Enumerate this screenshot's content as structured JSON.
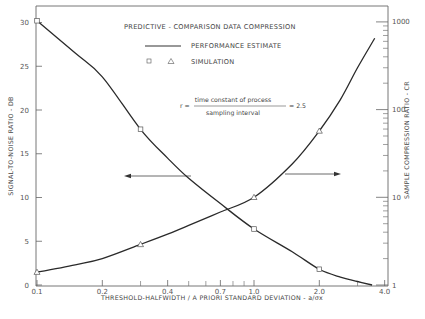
{
  "chart_data": {
    "type": "line",
    "title": "PREDICTIVE - COMPARISON DATA COMPRESSION",
    "xlabel": "THRESHOLD-HALFWIDTH / A PRIORI STANDARD DEVIATION - a/σx",
    "xscale": "log",
    "xlim": [
      0.1,
      4.0
    ],
    "x_ticks": [
      0.1,
      0.2,
      0.4,
      0.7,
      1.0,
      2.0,
      4.0
    ],
    "x_tick_labels": [
      "0.1",
      "0.2",
      "0.4",
      "0.7",
      "1.0",
      "2.0",
      "4.0"
    ],
    "x_minor_ticks": [
      0.3,
      0.5,
      0.6,
      0.8,
      0.9,
      3.0
    ],
    "y_left": {
      "label": "SIGNAL-TO-NOISE RATIO - DB",
      "scale": "linear",
      "lim": [
        0,
        30
      ],
      "ticks": [
        0,
        5,
        10,
        15,
        20,
        25,
        30
      ],
      "tick_labels": [
        "0",
        "5",
        "10",
        "15",
        "20",
        "25",
        "30"
      ]
    },
    "y_right": {
      "label": "SAMPLE COMPRESSION RATIO - CR",
      "scale": "log",
      "lim": [
        1,
        1000
      ],
      "ticks": [
        1,
        10,
        100,
        1000
      ],
      "tick_labels": [
        "1",
        "10",
        "100",
        "1000"
      ]
    },
    "legend": [
      {
        "label": "PERFORMANCE ESTIMATE",
        "marker": "line"
      },
      {
        "label": "SIMULATION",
        "marker": "square / triangle"
      }
    ],
    "annotation": {
      "prefix": "r =",
      "numerator": "time constant of process",
      "denominator": "sampling interval",
      "suffix": "= 2.5"
    },
    "series": [
      {
        "name": "Signal-to-noise ratio (performance estimate)",
        "axis": "left",
        "x": [
          0.1,
          0.15,
          0.2,
          0.3,
          0.4,
          0.5,
          0.7,
          1.0,
          1.5,
          2.0,
          2.5,
          3.0,
          3.5
        ],
        "values": [
          30.2,
          26.5,
          23.8,
          17.8,
          14.5,
          12.2,
          9.3,
          6.4,
          3.8,
          1.8,
          0.9,
          0.4,
          0.0
        ]
      },
      {
        "name": "Signal-to-noise ratio (simulation, squares)",
        "axis": "left",
        "x": [
          0.1,
          0.3,
          1.0,
          2.0
        ],
        "values": [
          30.2,
          17.8,
          6.4,
          1.8
        ]
      },
      {
        "name": "Compression ratio (performance estimate)",
        "axis": "right",
        "x": [
          0.1,
          0.15,
          0.2,
          0.3,
          0.4,
          0.5,
          0.7,
          1.0,
          1.5,
          2.0,
          2.5,
          3.0,
          3.6
        ],
        "values": [
          1.4,
          1.7,
          2.0,
          2.9,
          3.8,
          4.8,
          6.8,
          10,
          24,
          57,
          130,
          300,
          650
        ]
      },
      {
        "name": "Compression ratio (simulation, triangles)",
        "axis": "right",
        "x": [
          0.1,
          0.3,
          1.0,
          2.0
        ],
        "values": [
          1.4,
          2.9,
          10,
          57
        ]
      }
    ],
    "arrows": [
      {
        "direction": "left",
        "meaning": "SNR curve reads on left axis"
      },
      {
        "direction": "right",
        "meaning": "CR curve reads on right axis"
      }
    ],
    "grid": false,
    "legend_position": "upper center"
  }
}
